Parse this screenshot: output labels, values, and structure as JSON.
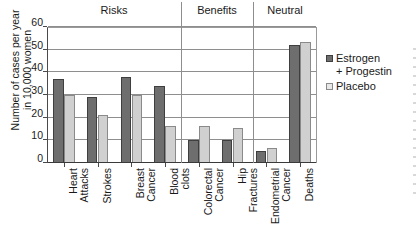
{
  "chart_data": {
    "type": "bar",
    "title": "",
    "xlabel": "",
    "ylabel": "Number of cases per year\nin 10,000 women",
    "ylim": [
      0,
      60
    ],
    "ytick_values": [
      0,
      10,
      20,
      30,
      40,
      50,
      60
    ],
    "ytick_labels": [
      "0",
      "10",
      "20",
      "30",
      "40",
      "50",
      "60"
    ],
    "grid": true,
    "legend_position": "right",
    "categories": [
      "Heart\nAttacks",
      "Strokes",
      "Breast\nCancer",
      "Blood\nclots",
      "Colorectal\nCancer",
      "Hip\nFractures",
      "Endometrial\nCancer",
      "Deaths"
    ],
    "series": [
      {
        "name": "Estrogen\n+ Progestin",
        "color": "#6e6e6e",
        "values": [
          37,
          29,
          38,
          34,
          10,
          10,
          5.5,
          52
        ]
      },
      {
        "name": "Placebo",
        "color": "#d0d0d0",
        "values": [
          30,
          21,
          30,
          16.5,
          16.5,
          15.5,
          6.5,
          53.5
        ]
      }
    ],
    "groups": [
      {
        "label": "Risks",
        "categories": [
          "Heart Attacks",
          "Strokes",
          "Breast Cancer",
          "Blood clots"
        ]
      },
      {
        "label": "Benefits",
        "categories": [
          "Colorectal Cancer",
          "Hip Fractures"
        ]
      },
      {
        "label": "Neutral",
        "categories": [
          "Endometrial Cancer",
          "Deaths"
        ]
      }
    ]
  },
  "legend": {
    "items": [
      {
        "label": "Estrogen\n+ Progestin"
      },
      {
        "label": "Placebo"
      }
    ]
  },
  "groups": {
    "risks": "Risks",
    "benefits": "Benefits",
    "neutral": "Neutral"
  },
  "axis": {
    "y_title": "Number of cases per year\nin 10,000 women"
  }
}
